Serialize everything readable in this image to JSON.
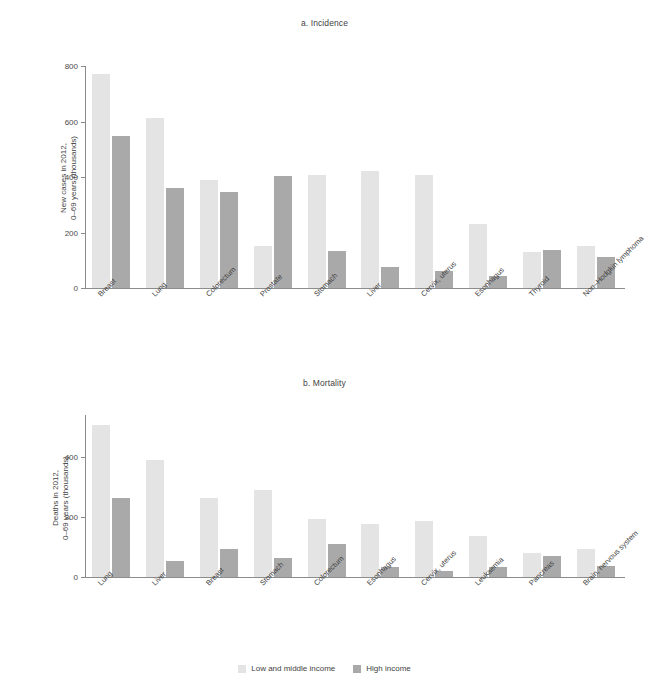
{
  "legend": {
    "items": [
      {
        "label": "Low and middle income",
        "color": "#e4e4e4",
        "key": "low"
      },
      {
        "label": "High income",
        "color": "#a9a9a9",
        "key": "high"
      }
    ]
  },
  "colors": {
    "low_income": "#e4e4e4",
    "high_income": "#a9a9a9",
    "axis": "#8c8c8c",
    "text": "#3f3f3f",
    "background": "#ffffff"
  },
  "chart_data": [
    {
      "id": "incidence",
      "type": "bar",
      "title": "a. Incidence",
      "xlabel": "",
      "ylabel": "New cases in 2012,\n0–69 years (thousands)",
      "ylabel_line1": "New cases in 2012,",
      "ylabel_line2": "0–69 years (thousands)",
      "ylim": [
        0,
        800
      ],
      "yticks": [
        0,
        200,
        400,
        600,
        800
      ],
      "grid": false,
      "legend_position": "bottom-center",
      "categories": [
        "Breast",
        "Lung",
        "Colorectum",
        "Prostate",
        "Stomach",
        "Liver",
        "Cervix, uterus",
        "Esophagus",
        "Thyroid",
        "Non–Hodgkin lymphoma"
      ],
      "series": [
        {
          "name": "Low and middle income",
          "values": [
            770,
            613,
            389,
            152,
            407,
            422,
            407,
            230,
            128,
            151
          ]
        },
        {
          "name": "High income",
          "values": [
            549,
            361,
            347,
            404,
            133,
            76,
            62,
            44,
            136,
            110
          ]
        }
      ]
    },
    {
      "id": "mortality",
      "type": "bar",
      "title": "b. Mortality",
      "xlabel": "",
      "ylabel": "Deaths in 2012,\n0–69 years (thousands)",
      "ylabel_line1": "Deaths in 2012,",
      "ylabel_line2": "0–69 years (thousands)",
      "ylim": [
        0,
        540
      ],
      "yticks": [
        0,
        200,
        400
      ],
      "grid": false,
      "legend_position": "bottom-center",
      "categories": [
        "Lung",
        "Liver",
        "Breast",
        "Stomach",
        "Colorectum",
        "Esophagus",
        "Cervix, uterus",
        "Leukaemia",
        "Pancreas",
        "Brain, nervous system"
      ],
      "series": [
        {
          "name": "Low and middle income",
          "values": [
            506,
            390,
            264,
            291,
            194,
            178,
            186,
            136,
            80,
            95
          ]
        },
        {
          "name": "High income",
          "values": [
            263,
            55,
            93,
            62,
            110,
            35,
            19,
            33,
            69,
            38
          ]
        }
      ]
    }
  ]
}
